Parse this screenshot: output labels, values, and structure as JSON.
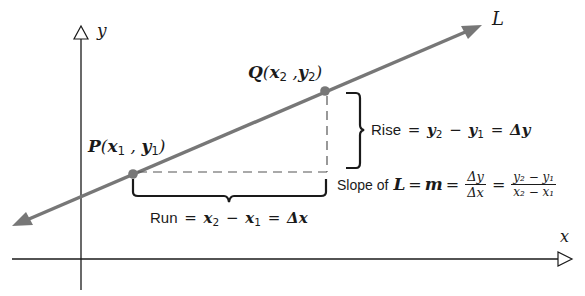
{
  "diagram": {
    "type": "coordinate-geometry",
    "colors": {
      "line": "#777777",
      "axis": "#1a1a1a",
      "point": "#777777",
      "text": "#1a1a1a"
    },
    "axes": {
      "x_label": "x",
      "y_label": "y"
    },
    "line": {
      "label": "L"
    },
    "points": {
      "P": {
        "name": "P",
        "coords_text": "(x1 , y1)",
        "x_sym": "x",
        "x_sub": "1",
        "y_sym": "y",
        "y_sub": "1"
      },
      "Q": {
        "name": "Q",
        "coords_text": "(x2 ,y2)",
        "x_sym": "x",
        "x_sub": "2",
        "y_sym": "y",
        "y_sub": "2"
      }
    },
    "rise": {
      "word": "Rise",
      "eq": "=",
      "y2": "y",
      "y2_sub": "2",
      "minus": "−",
      "y1": "y",
      "y1_sub": "1",
      "eq2": "=",
      "delta": "Δy"
    },
    "run": {
      "word": "Run",
      "eq": "=",
      "x2": "x",
      "x2_sub": "2",
      "minus": "−",
      "x1": "x",
      "x1_sub": "1",
      "eq2": "=",
      "delta": "Δx"
    },
    "slope": {
      "prefix": "Slope of",
      "L": "L",
      "eq1": "=",
      "m": "m",
      "eq2": "=",
      "frac1_num": "Δy",
      "frac1_den": "Δx",
      "eq3": "=",
      "frac2_num": "y₂ − y₁",
      "frac2_den": "x₂ − x₁"
    }
  }
}
